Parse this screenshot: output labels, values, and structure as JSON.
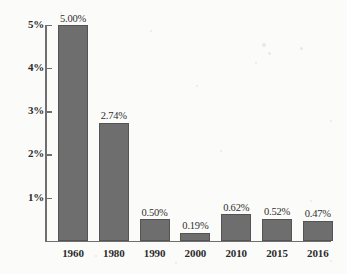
{
  "chart_data": {
    "type": "bar",
    "title": "",
    "subtitle": "",
    "xlabel": "",
    "ylabel": "",
    "categories": [
      "1960",
      "1980",
      "1990",
      "2000",
      "2010",
      "2015",
      "2016"
    ],
    "values": [
      5.0,
      2.74,
      0.5,
      0.19,
      0.62,
      0.52,
      0.47
    ],
    "value_labels": [
      "5.00%",
      "2.74%",
      "0.50%",
      "0.19%",
      "0.62%",
      "0.52%",
      "0.47%"
    ],
    "ylim": [
      0,
      5
    ],
    "y_ticks": [
      1,
      2,
      3,
      4,
      5
    ],
    "y_tick_labels": [
      "1%",
      "2%",
      "3%",
      "4%",
      "5%"
    ],
    "grid": false,
    "legend": null,
    "series": [
      {
        "name": "",
        "values": [
          5.0,
          2.74,
          0.5,
          0.19,
          0.62,
          0.52,
          0.47
        ]
      }
    ],
    "colors": {
      "bar_fill": "#6e6e6e",
      "bar_border": "#545454",
      "axis": "#6f6f6f",
      "text": "#2c2c2c",
      "background": "#fbfbf9"
    }
  }
}
